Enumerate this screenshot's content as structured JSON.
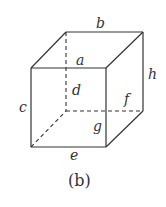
{
  "figure": {
    "caption": "(b)",
    "type": "cube-edge-labels",
    "edge_labels": {
      "a": "a",
      "b": "b",
      "c": "c",
      "d": "d",
      "e": "e",
      "f": "f",
      "g": "g",
      "h": "h"
    },
    "visible_edges": 9,
    "hidden_edges": 3,
    "stroke_color": "#333333"
  }
}
